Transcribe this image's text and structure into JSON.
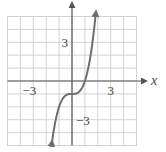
{
  "chart_data": {
    "type": "line",
    "title": "",
    "xlabel": "x",
    "ylabel": "",
    "xlim": [
      -5,
      5
    ],
    "ylim": [
      -5,
      5
    ],
    "grid": true,
    "grid_step": 1,
    "x_tick_labels": [
      {
        "value": -3,
        "label": "−3"
      },
      {
        "value": 3,
        "label": "3"
      }
    ],
    "y_tick_labels": [
      {
        "value": 3,
        "label": "3"
      },
      {
        "value": -3,
        "label": "−3"
      }
    ],
    "series": [
      {
        "name": "f(x) ≈ x^3 − 1",
        "x": [
          -1.55,
          -1.25,
          -1.0,
          -0.75,
          -0.5,
          -0.25,
          0.0,
          0.25,
          0.5,
          0.75,
          1.0,
          1.25,
          1.5,
          1.85
        ],
        "y": [
          -4.72,
          -2.95,
          -2.0,
          -1.42,
          -1.13,
          -1.02,
          -1.0,
          -0.98,
          -0.88,
          -0.58,
          0.0,
          0.95,
          2.38,
          5.33
        ],
        "arrows": "both ends"
      }
    ],
    "annotations": []
  },
  "style": {
    "grid_color": "#c8c8c8",
    "axis_color": "#555555",
    "curve_color": "#6e6e6e",
    "label_color": "#444444"
  }
}
